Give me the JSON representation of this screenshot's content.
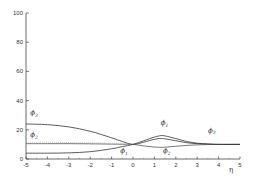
{
  "chart_data": {
    "type": "line",
    "title": "",
    "xlabel": "η",
    "ylabel": "",
    "xlim": [
      -5,
      5
    ],
    "ylim": [
      0,
      100
    ],
    "x_ticks": [
      -5,
      -4,
      -3,
      -2,
      -1,
      0,
      1,
      2,
      3,
      4,
      5
    ],
    "y_ticks": [
      0,
      20,
      40,
      60,
      80,
      100
    ],
    "grid": false,
    "legend": "inline labels",
    "x": [
      -5,
      -4,
      -3,
      -2,
      -1,
      -0.5,
      0,
      0.5,
      1,
      1.3,
      1.5,
      2,
      2.5,
      3,
      3.5,
      4,
      5
    ],
    "series": [
      {
        "name": "φ3",
        "values": [
          24,
          23.5,
          22,
          19,
          14.5,
          12,
          10,
          11.5,
          13.5,
          14,
          13.8,
          12.5,
          11.2,
          10.5,
          10.2,
          10,
          10
        ]
      },
      {
        "name": "φ2",
        "values": [
          10.5,
          10.5,
          10.5,
          10.4,
          10.2,
          10.1,
          10,
          9,
          8.2,
          8,
          8.1,
          8.7,
          9.3,
          9.7,
          9.9,
          10,
          10
        ]
      },
      {
        "name": "φ1",
        "values": [
          4,
          4,
          4.2,
          5,
          7,
          8.5,
          10,
          12.5,
          15,
          16,
          15.8,
          14,
          12,
          10.8,
          10.3,
          10,
          10
        ]
      }
    ],
    "annotations": [
      {
        "text": "φ3",
        "x": -4.8,
        "y": 30
      },
      {
        "text": "φ2",
        "x": -4.8,
        "y": 15
      },
      {
        "text": "φ1",
        "x": -0.6,
        "y": 4
      },
      {
        "text": "φ1",
        "x": 1.3,
        "y": 23
      },
      {
        "text": "φ2",
        "x": 1.4,
        "y": 4
      },
      {
        "text": "φ3",
        "x": 3.5,
        "y": 18
      }
    ]
  },
  "labels": {
    "phi1": "ϕ",
    "phi1_sub": "1",
    "phi2": "ϕ",
    "phi2_sub": "2",
    "phi3": "ϕ",
    "phi3_sub": "3",
    "eta": "η"
  }
}
